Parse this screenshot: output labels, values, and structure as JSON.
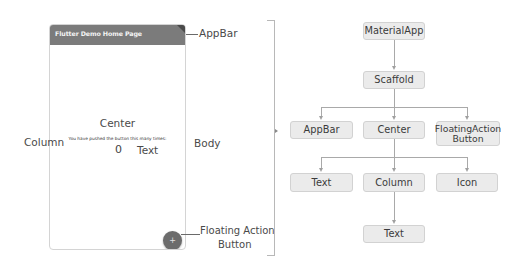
{
  "phone": {
    "appbar_title": "Flutter Demo Home Page",
    "center_label": "Center",
    "body_text": "You have pushed the button this many times:",
    "counter_value": "0",
    "text_label": "Text",
    "fab_icon": "plus-icon"
  },
  "annotations": {
    "appbar": "AppBar",
    "column": "Column",
    "body": "Body",
    "fab_line1": "Floating Action",
    "fab_line2": "Button"
  },
  "tree": {
    "nodes": {
      "material_app": "MaterialApp",
      "scaffold": "Scaffold",
      "appbar": "AppBar",
      "center": "Center",
      "fab_line1": "FloatingAction",
      "fab_line2": "Button",
      "text_left": "Text",
      "column": "Column",
      "icon": "Icon",
      "text_bottom": "Text"
    },
    "edges": [
      [
        "MaterialApp",
        "Scaffold"
      ],
      [
        "Scaffold",
        "AppBar"
      ],
      [
        "Scaffold",
        "Center"
      ],
      [
        "Scaffold",
        "FloatingActionButton"
      ],
      [
        "Center",
        "Text"
      ],
      [
        "Center",
        "Column"
      ],
      [
        "Center",
        "Icon"
      ],
      [
        "Column",
        "Text"
      ]
    ]
  },
  "colors": {
    "appbar": "#7b7b7b",
    "fab": "#6c6c6c",
    "node_fill": "#ebebeb",
    "node_border": "#d2d2d2",
    "connector": "#a9a9a9"
  }
}
